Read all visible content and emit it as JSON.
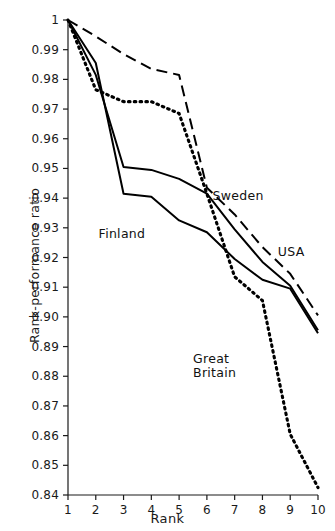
{
  "chart_data": {
    "type": "line",
    "title": "",
    "xlabel": "Rank",
    "ylabel": "Rank-performance ratio",
    "xlim": [
      1,
      10
    ],
    "ylim": [
      0.84,
      1.0
    ],
    "grid": false,
    "legend_position": "inline-annotations",
    "x": [
      1,
      2,
      3,
      4,
      5,
      6,
      7,
      8,
      9,
      10
    ],
    "xtick_labels": [
      "1",
      "2",
      "3",
      "4",
      "5",
      "6",
      "7",
      "8",
      "9",
      "10"
    ],
    "ytick_labels": [
      "1",
      "0.99",
      "0.98",
      "0.97",
      "0.96",
      "0.95",
      "0.94",
      "0.93",
      "0.92",
      "0.91",
      "0.90",
      "0.89",
      "0.88",
      "0.87",
      "0.86",
      "0.85",
      "0.84"
    ],
    "ytick_values": [
      1.0,
      0.99,
      0.98,
      0.97,
      0.96,
      0.95,
      0.94,
      0.93,
      0.92,
      0.91,
      0.9,
      0.89,
      0.88,
      0.87,
      0.86,
      0.85,
      0.84
    ],
    "series": [
      {
        "name": "Sweden",
        "style": "solid",
        "color": "#000000",
        "values": [
          1.0,
          0.9815,
          0.9505,
          0.9495,
          0.9465,
          0.9415,
          0.9295,
          0.9185,
          0.9105,
          0.8955
        ]
      },
      {
        "name": "Finland",
        "style": "solid",
        "color": "#000000",
        "values": [
          1.0,
          0.9855,
          0.9415,
          0.9405,
          0.9325,
          0.9285,
          0.9195,
          0.9125,
          0.9095,
          0.8945
        ]
      },
      {
        "name": "USA",
        "style": "dashed",
        "color": "#000000",
        "values": [
          1.0,
          0.9945,
          0.9885,
          0.9835,
          0.9815,
          0.9435,
          0.9345,
          0.9235,
          0.9145,
          0.9005
        ]
      },
      {
        "name": "Great Britain",
        "style": "dotted",
        "color": "#000000",
        "values": [
          1.0,
          0.9765,
          0.9725,
          0.9725,
          0.9685,
          0.9415,
          0.9135,
          0.9055,
          0.8605,
          0.8425
        ]
      }
    ],
    "annotations": [
      {
        "text": "Sweden",
        "x": 6.2,
        "y": 0.9405
      },
      {
        "text": "Finland",
        "x": 2.1,
        "y": 0.9275
      },
      {
        "text": "USA",
        "x": 8.55,
        "y": 0.9215
      },
      {
        "text": "Great\nBritain",
        "x": 5.5,
        "y": 0.8855
      }
    ]
  }
}
